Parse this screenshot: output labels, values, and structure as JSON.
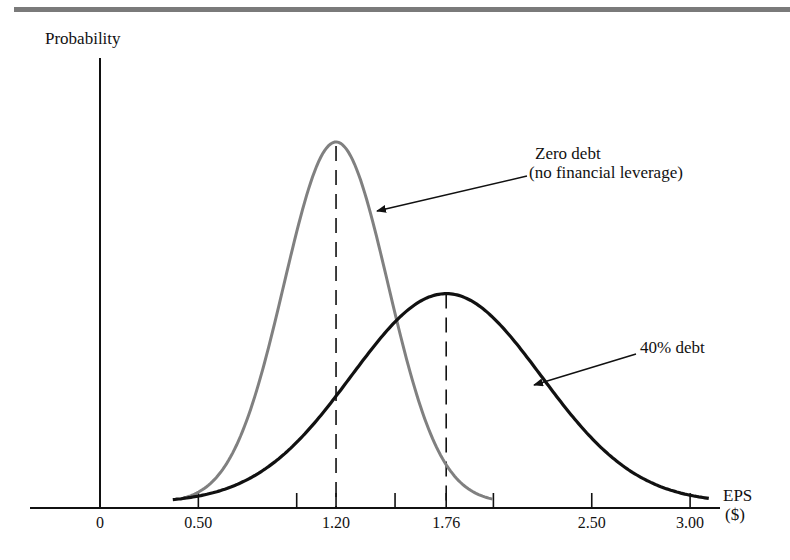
{
  "chart_data": {
    "type": "line",
    "title": "",
    "xlabel": "EPS ($)",
    "ylabel": "Probability",
    "xlabel_lines": [
      "EPS",
      "($)"
    ],
    "x_ticks_labeled": [
      0,
      0.5,
      1.2,
      1.76,
      2.5,
      3.0
    ],
    "x_tick_labels": [
      "0",
      "0.50",
      "1.20",
      "1.76",
      "2.50",
      "3.00"
    ],
    "x_ticks_unlabeled_approx": [
      1.0,
      1.5,
      2.0
    ],
    "xlim": [
      -0.35,
      3.2
    ],
    "grid": false,
    "legend": "annotations with arrows",
    "series": [
      {
        "name": "Zero debt (no financial leverage)",
        "label_lines": [
          "Zero debt",
          "(no financial leverage)"
        ],
        "color": "#808080",
        "distribution": "normal",
        "mean": 1.2,
        "x_range": [
          0.42,
          2.0
        ],
        "relative_peak": 1.0,
        "mean_marker": "dashed vertical line"
      },
      {
        "name": "40% debt",
        "label_lines": [
          "40% debt"
        ],
        "color": "#111111",
        "distribution": "normal",
        "mean": 1.76,
        "x_range": [
          0.37,
          3.1
        ],
        "relative_peak": 0.58,
        "mean_marker": "dashed vertical line"
      }
    ]
  },
  "labels": {
    "y_axis": "Probability",
    "x_axis_line1": "EPS",
    "x_axis_line2": "($)",
    "zero_debt_line1": "Zero debt",
    "zero_debt_line2": "(no financial leverage)",
    "forty_debt": "40% debt"
  },
  "colors": {
    "header_bar": "#7a7a7a",
    "zero_debt_curve": "#808080",
    "forty_debt_curve": "#111111",
    "axis": "#111111"
  }
}
